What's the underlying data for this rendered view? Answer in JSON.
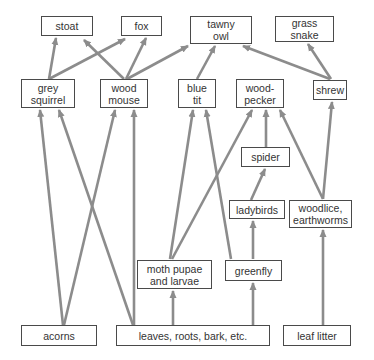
{
  "diagram": {
    "type": "food-web",
    "arrow_color": "#8c8c8c",
    "box_border_color": "#4a4a4a",
    "text_color": "#333333",
    "nodes": [
      {
        "id": "stoat",
        "label": "stoat",
        "x": 41,
        "y": 16,
        "w": 52,
        "h": 20
      },
      {
        "id": "fox",
        "label": "fox",
        "x": 121,
        "y": 16,
        "w": 41,
        "h": 20
      },
      {
        "id": "tawny_owl",
        "label": "tawny\nowl",
        "x": 190,
        "y": 16,
        "w": 62,
        "h": 28
      },
      {
        "id": "grass_snake",
        "label": "grass\nsnake",
        "x": 275,
        "y": 16,
        "w": 59,
        "h": 26
      },
      {
        "id": "grey_squirrel",
        "label": "grey\nsquirrel",
        "x": 21,
        "y": 79,
        "w": 54,
        "h": 29
      },
      {
        "id": "wood_mouse",
        "label": "wood\nmouse",
        "x": 100,
        "y": 79,
        "w": 48,
        "h": 29
      },
      {
        "id": "blue_tit",
        "label": "blue\ntit",
        "x": 178,
        "y": 79,
        "w": 38,
        "h": 29
      },
      {
        "id": "woodpecker",
        "label": "wood-\npecker",
        "x": 236,
        "y": 79,
        "w": 48,
        "h": 29
      },
      {
        "id": "shrew",
        "label": "shrew",
        "x": 313,
        "y": 80,
        "w": 34,
        "h": 20
      },
      {
        "id": "spider",
        "label": "spider",
        "x": 241,
        "y": 147,
        "w": 49,
        "h": 20
      },
      {
        "id": "ladybirds",
        "label": "ladybirds",
        "x": 229,
        "y": 200,
        "w": 56,
        "h": 19
      },
      {
        "id": "woodlice",
        "label": "woodlice,\nearthworms",
        "x": 289,
        "y": 200,
        "w": 63,
        "h": 28
      },
      {
        "id": "moth",
        "label": "moth pupae\nand larvae",
        "x": 137,
        "y": 260,
        "w": 75,
        "h": 29
      },
      {
        "id": "greenfly",
        "label": "greenfly",
        "x": 225,
        "y": 260,
        "w": 57,
        "h": 21
      },
      {
        "id": "acorns",
        "label": "acorns",
        "x": 21,
        "y": 325,
        "w": 76,
        "h": 21
      },
      {
        "id": "leaves",
        "label": "leaves, roots, bark, etc.",
        "x": 116,
        "y": 325,
        "w": 154,
        "h": 21
      },
      {
        "id": "leaf_litter",
        "label": "leaf litter",
        "x": 283,
        "y": 325,
        "w": 68,
        "h": 21
      }
    ],
    "edges": [
      {
        "from": "grey_squirrel",
        "to": "stoat",
        "x1": 49,
        "y1": 79,
        "x2": 56,
        "y2": 38
      },
      {
        "from": "grey_squirrel",
        "to": "fox",
        "x1": 49,
        "y1": 79,
        "x2": 125,
        "y2": 39
      },
      {
        "from": "wood_mouse",
        "to": "stoat",
        "x1": 124,
        "y1": 79,
        "x2": 84,
        "y2": 40
      },
      {
        "from": "wood_mouse",
        "to": "fox",
        "x1": 126,
        "y1": 79,
        "x2": 146,
        "y2": 38
      },
      {
        "from": "wood_mouse",
        "to": "tawny_owl",
        "x1": 127,
        "y1": 79,
        "x2": 188,
        "y2": 46
      },
      {
        "from": "blue_tit",
        "to": "tawny_owl",
        "x1": 197,
        "y1": 79,
        "x2": 215,
        "y2": 46
      },
      {
        "from": "shrew",
        "to": "tawny_owl",
        "x1": 330,
        "y1": 79,
        "x2": 243,
        "y2": 46
      },
      {
        "from": "shrew",
        "to": "grass_snake",
        "x1": 331,
        "y1": 79,
        "x2": 308,
        "y2": 44
      },
      {
        "from": "acorns",
        "to": "grey_squirrel",
        "x1": 63,
        "y1": 325,
        "x2": 40,
        "y2": 110
      },
      {
        "from": "acorns",
        "to": "wood_mouse",
        "x1": 64,
        "y1": 325,
        "x2": 115,
        "y2": 110
      },
      {
        "from": "leaves",
        "to": "grey_squirrel",
        "x1": 133,
        "y1": 325,
        "x2": 59,
        "y2": 110
      },
      {
        "from": "leaves",
        "to": "wood_mouse",
        "x1": 134,
        "y1": 325,
        "x2": 134,
        "y2": 110
      },
      {
        "from": "leaves",
        "to": "moth",
        "x1": 173,
        "y1": 325,
        "x2": 173,
        "y2": 291
      },
      {
        "from": "leaves",
        "to": "greenfly",
        "x1": 253,
        "y1": 325,
        "x2": 253,
        "y2": 283
      },
      {
        "from": "moth",
        "to": "blue_tit",
        "x1": 170,
        "y1": 259,
        "x2": 193,
        "y2": 110
      },
      {
        "from": "moth",
        "to": "woodpecker",
        "x1": 172,
        "y1": 259,
        "x2": 252,
        "y2": 110
      },
      {
        "from": "greenfly",
        "to": "blue_tit",
        "x1": 231,
        "y1": 259,
        "x2": 206,
        "y2": 110
      },
      {
        "from": "greenfly",
        "to": "ladybirds",
        "x1": 253,
        "y1": 259,
        "x2": 253,
        "y2": 221
      },
      {
        "from": "ladybirds",
        "to": "spider",
        "x1": 251,
        "y1": 200,
        "x2": 265,
        "y2": 169
      },
      {
        "from": "spider",
        "to": "woodpecker",
        "x1": 266,
        "y1": 147,
        "x2": 266,
        "y2": 110
      },
      {
        "from": "woodlice",
        "to": "woodpecker",
        "x1": 323,
        "y1": 199,
        "x2": 280,
        "y2": 110
      },
      {
        "from": "woodlice",
        "to": "shrew",
        "x1": 323,
        "y1": 199,
        "x2": 332,
        "y2": 102
      },
      {
        "from": "leaf_litter",
        "to": "woodlice",
        "x1": 323,
        "y1": 325,
        "x2": 323,
        "y2": 230
      }
    ]
  }
}
